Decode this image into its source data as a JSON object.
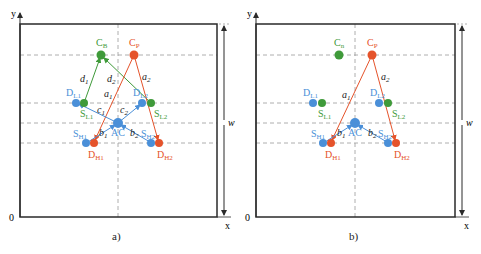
{
  "colors": {
    "green": "#3f9a3a",
    "orange": "#e5532b",
    "blue": "#4a8fd8",
    "frame": "#2a2a2a",
    "dash": "#9a9a9a"
  },
  "axes": {
    "y_label": "y",
    "x_label": "x",
    "origin_label": "0",
    "width_label": "w"
  },
  "panels": [
    {
      "caption": "a)",
      "nodes": {
        "CB": {
          "label": "C",
          "sub": "B"
        },
        "CP": {
          "label": "C",
          "sub": "P"
        },
        "DL1": {
          "label": "D",
          "sub": "L1"
        },
        "SL1": {
          "label": "S",
          "sub": "L1"
        },
        "DL2": {
          "label": "D",
          "sub": "L2"
        },
        "SL2": {
          "label": "S",
          "sub": "L2"
        },
        "AC": {
          "label": "AC"
        },
        "SH1": {
          "label": "S",
          "sub": "H1"
        },
        "DH1": {
          "label": "D",
          "sub": "H1"
        },
        "SH2": {
          "label": "S",
          "sub": "H2"
        },
        "DH2": {
          "label": "D",
          "sub": "H2"
        }
      },
      "edges": {
        "d1": {
          "label": "d",
          "sub": "1"
        },
        "d2": {
          "label": "d",
          "sub": "2"
        },
        "a1": {
          "label": "a",
          "sub": "1"
        },
        "a2": {
          "label": "a",
          "sub": "2"
        },
        "c1": {
          "label": "c",
          "sub": "1"
        },
        "c2": {
          "label": "c",
          "sub": "2"
        },
        "b1": {
          "label": "b",
          "sub": "1"
        },
        "b2": {
          "label": "b",
          "sub": "2"
        }
      }
    },
    {
      "caption": "b)",
      "nodes": {
        "Cn": {
          "label": "C",
          "sub": "n"
        },
        "CP": {
          "label": "C",
          "sub": "P"
        },
        "DL1": {
          "label": "D",
          "sub": "L1"
        },
        "SL1": {
          "label": "S",
          "sub": "L1"
        },
        "DL2": {
          "label": "D",
          "sub": "L2"
        },
        "SL2": {
          "label": "S",
          "sub": "L2"
        },
        "AC": {
          "label": "AC"
        },
        "SH1": {
          "label": "S",
          "sub": "H1"
        },
        "DH1": {
          "label": "D",
          "sub": "H1"
        },
        "SH2": {
          "label": "S",
          "sub": "H2"
        },
        "DH2": {
          "label": "D",
          "sub": "H2"
        }
      },
      "edges": {
        "a1": {
          "label": "a",
          "sub": "1"
        },
        "a2": {
          "label": "a",
          "sub": "2"
        },
        "b1": {
          "label": "b",
          "sub": "1"
        },
        "b2": {
          "label": "b",
          "sub": "2"
        }
      }
    }
  ]
}
